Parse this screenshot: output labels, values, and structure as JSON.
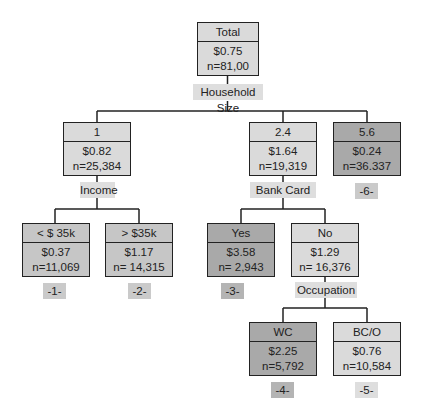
{
  "root": {
    "header": "Total",
    "value": "$0.75",
    "n": "n=81,00",
    "split": "Household Size",
    "children": [
      {
        "header": "1",
        "value": "$0.82",
        "n": "n=25,384",
        "split": "Income",
        "children": [
          {
            "header": "< $ 35k",
            "value": "$0.37",
            "n": "n=11,069",
            "leaf": "-1-"
          },
          {
            "header": "> $35k",
            "value": "$1.17",
            "n": "n= 14,315",
            "leaf": "-2-"
          }
        ]
      },
      {
        "header": "2.4",
        "value": "$1.64",
        "n": "n=19,319",
        "split": "Bank Card",
        "children": [
          {
            "header": "Yes",
            "value": "$3.58",
            "n": "n= 2,943",
            "leaf": "-3-"
          },
          {
            "header": "No",
            "value": "$1.29",
            "n": "n= 16,376",
            "split": "Occupation",
            "children": [
              {
                "header": "WC",
                "value": "$2.25",
                "n": "n=5,792",
                "leaf": "-4-"
              },
              {
                "header": "BC/O",
                "value": "$0.76",
                "n": "n=10,584",
                "leaf": "-5-"
              }
            ]
          }
        ]
      },
      {
        "header": "5.6",
        "value": "$0.24",
        "n": "n=36.337",
        "leaf": "-6-"
      }
    ]
  },
  "colors": {
    "light": "#dadada",
    "mid": "#c6c6c6",
    "dark": "#a9a9a9",
    "line": "#222222"
  }
}
